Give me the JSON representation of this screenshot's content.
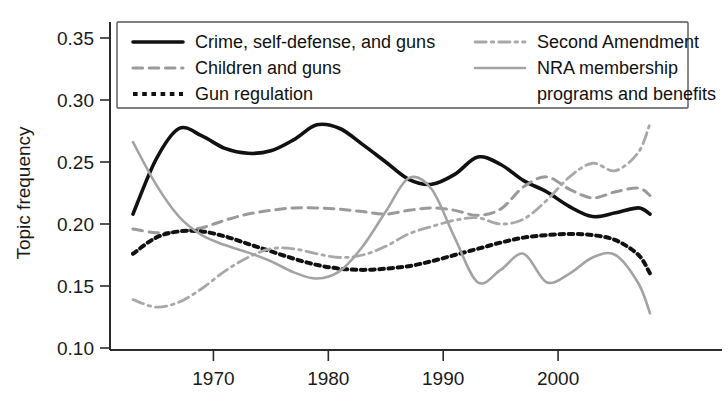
{
  "chart_data": {
    "type": "line",
    "title": "",
    "xlabel": "",
    "ylabel": "Topic frequency",
    "xlim": [
      1963,
      2008
    ],
    "ylim": [
      0.1,
      0.35
    ],
    "grid": false,
    "legend_position": "top-inside",
    "xticks": [
      1970,
      1980,
      1990,
      2000
    ],
    "yticks": [
      "0.10",
      "0.15",
      "0.20",
      "0.25",
      "0.30",
      "0.35"
    ],
    "ytick_values": [
      0.1,
      0.15,
      0.2,
      0.25,
      0.3,
      0.35
    ],
    "x": [
      1963,
      1965,
      1967,
      1969,
      1971,
      1973,
      1975,
      1977,
      1979,
      1981,
      1983,
      1985,
      1987,
      1989,
      1991,
      1993,
      1995,
      1997,
      1999,
      2001,
      2003,
      2005,
      2007,
      2008
    ],
    "series": [
      {
        "name": "Crime, self-defense, and guns",
        "style": "solid",
        "color": "#111111",
        "width": 3.6,
        "values": [
          0.208,
          0.252,
          0.277,
          0.271,
          0.261,
          0.257,
          0.259,
          0.268,
          0.28,
          0.277,
          0.264,
          0.25,
          0.236,
          0.232,
          0.24,
          0.254,
          0.248,
          0.235,
          0.226,
          0.214,
          0.206,
          0.209,
          0.213,
          0.208
        ]
      },
      {
        "name": "Children and guns",
        "style": "dashed",
        "color": "#9a9a9a",
        "width": 3.0,
        "values": [
          0.196,
          0.193,
          0.194,
          0.197,
          0.203,
          0.208,
          0.211,
          0.213,
          0.213,
          0.212,
          0.21,
          0.208,
          0.211,
          0.213,
          0.211,
          0.207,
          0.212,
          0.23,
          0.238,
          0.228,
          0.221,
          0.226,
          0.229,
          0.223
        ]
      },
      {
        "name": "Gun regulation",
        "style": "dotted",
        "color": "#111111",
        "width": 4.0,
        "values": [
          0.176,
          0.189,
          0.194,
          0.194,
          0.19,
          0.184,
          0.178,
          0.172,
          0.167,
          0.164,
          0.163,
          0.164,
          0.166,
          0.17,
          0.175,
          0.18,
          0.185,
          0.189,
          0.191,
          0.192,
          0.191,
          0.187,
          0.175,
          0.16
        ]
      },
      {
        "name": "Second Amendment",
        "style": "dashdot",
        "color": "#a8a8a8",
        "width": 2.8,
        "values": [
          0.139,
          0.133,
          0.137,
          0.148,
          0.162,
          0.173,
          0.18,
          0.18,
          0.176,
          0.173,
          0.175,
          0.182,
          0.192,
          0.198,
          0.203,
          0.205,
          0.2,
          0.204,
          0.219,
          0.238,
          0.249,
          0.243,
          0.258,
          0.281
        ]
      },
      {
        "name": "NRA membership programs and benefits",
        "style": "solid",
        "color": "#a3a3a3",
        "width": 2.6,
        "values": [
          0.266,
          0.232,
          0.206,
          0.191,
          0.183,
          0.177,
          0.17,
          0.161,
          0.156,
          0.162,
          0.182,
          0.21,
          0.237,
          0.228,
          0.189,
          0.153,
          0.163,
          0.176,
          0.153,
          0.16,
          0.173,
          0.175,
          0.152,
          0.128
        ]
      }
    ]
  },
  "legend": {
    "entries": [
      {
        "label": "Crime, self-defense, and guns",
        "style": "solid",
        "color": "#111111",
        "width": 3.6,
        "col": 0,
        "row": 0
      },
      {
        "label": "Children and guns",
        "style": "dashed",
        "color": "#9a9a9a",
        "width": 3.0,
        "col": 0,
        "row": 1
      },
      {
        "label": "Gun regulation",
        "style": "dotted",
        "color": "#111111",
        "width": 4.0,
        "col": 0,
        "row": 2
      },
      {
        "label": "Second Amendment",
        "style": "dashdot",
        "color": "#a8a8a8",
        "width": 2.8,
        "col": 1,
        "row": 0
      },
      {
        "label": "NRA membership",
        "style": "solid",
        "color": "#a3a3a3",
        "width": 2.6,
        "col": 1,
        "row": 1
      },
      {
        "label": "programs and benefits",
        "style": "none",
        "color": "#a3a3a3",
        "width": 0,
        "col": 1,
        "row": 2
      }
    ]
  }
}
